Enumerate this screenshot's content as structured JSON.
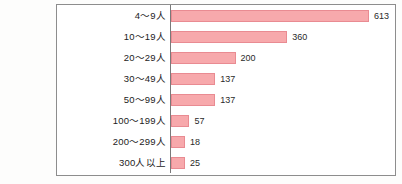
{
  "chart_data": {
    "type": "bar",
    "orientation": "horizontal",
    "title": "",
    "xlabel": "",
    "ylabel": "",
    "grid": false,
    "legend": null,
    "xlim": [
      0,
      613
    ],
    "categories": [
      "4〜9人",
      "10〜19人",
      "20〜29人",
      "30〜49人",
      "50〜99人",
      "100〜199人",
      "200〜299人",
      "300人以上"
    ],
    "values": [
      613,
      360,
      200,
      137,
      137,
      57,
      18,
      25
    ],
    "value_labels": [
      "613",
      "360",
      "200",
      "137",
      "137",
      "57",
      "18",
      "25"
    ],
    "bars": [
      {
        "category": "4〜9人",
        "value": 613,
        "label": "613"
      },
      {
        "category": "10〜19人",
        "value": 360,
        "label": "360"
      },
      {
        "category": "20〜29人",
        "value": 200,
        "label": "200"
      },
      {
        "category": "30〜49人",
        "value": 137,
        "label": "137"
      },
      {
        "category": "50〜99人",
        "value": 137,
        "label": "137"
      },
      {
        "category": "100〜199人",
        "value": 57,
        "label": "57"
      },
      {
        "category": "200〜299人",
        "value": 18,
        "label": "18"
      },
      {
        "category": "300人以上",
        "value": 25,
        "label": "25"
      }
    ],
    "colors": {
      "bar_fill": "#f7a9ac",
      "bar_border": "#e98b92",
      "frame": "#8d8d8d",
      "axis": "#7a7a7a",
      "text": "#1c1c1c",
      "background": "#ffffff"
    }
  }
}
